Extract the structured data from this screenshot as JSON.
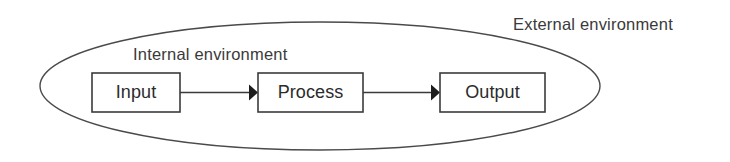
{
  "diagram": {
    "background_color": "#ffffff",
    "labels": {
      "external_environment": "External environment",
      "internal_environment": "Internal environment"
    },
    "boundary": {
      "name": "internal-environment-ellipse",
      "shape": "ellipse",
      "stroke_color": "#4a4a4a",
      "cx": 320,
      "cy": 86,
      "rx": 280,
      "ry": 64
    },
    "nodes": [
      {
        "id": "input",
        "label": "Input",
        "x": 92,
        "y": 73,
        "width": 88,
        "height": 39,
        "stroke_color": "#3b3b3b",
        "fill_color": "#ffffff"
      },
      {
        "id": "process",
        "label": "Process",
        "x": 258,
        "y": 73,
        "width": 105,
        "height": 39,
        "stroke_color": "#3b3b3b",
        "fill_color": "#ffffff"
      },
      {
        "id": "output",
        "label": "Output",
        "x": 440,
        "y": 73,
        "width": 105,
        "height": 39,
        "stroke_color": "#3b3b3b",
        "fill_color": "#ffffff"
      }
    ],
    "connectors": [
      {
        "id": "input-to-process",
        "from": "input",
        "to": "process",
        "x1": 180,
        "x2": 258,
        "y": 92.5,
        "color": "#1c1c1c"
      },
      {
        "id": "process-to-output",
        "from": "process",
        "to": "output",
        "x1": 363,
        "x2": 440,
        "y": 92.5,
        "color": "#1c1c1c"
      }
    ],
    "text_positions": {
      "external_environment": {
        "x": 513,
        "y": 30
      },
      "internal_environment": {
        "x": 133,
        "y": 60
      }
    }
  }
}
